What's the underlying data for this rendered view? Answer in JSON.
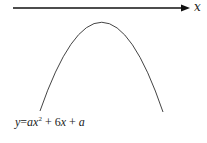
{
  "diagram": {
    "axis": {
      "label": "x",
      "direction": "right",
      "y_position": 8
    },
    "curve": {
      "type": "parabola",
      "opens": "down",
      "vertex": [
        102,
        22
      ]
    },
    "equation": {
      "lhs": "y",
      "equals": "=",
      "term1_coef": "a",
      "term1_var": "x",
      "term1_exp": "2",
      "plus1": "+",
      "term2": "6",
      "term2_var": "x",
      "plus2": "+",
      "term3": "a",
      "full_text": "y = ax² + 6x + a"
    }
  }
}
